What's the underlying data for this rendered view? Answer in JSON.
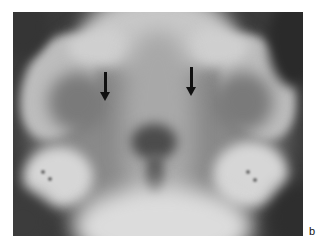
{
  "figure": {
    "panel_label": "b",
    "image_type": "radiograph",
    "annotations": [
      {
        "type": "arrow",
        "direction": "down",
        "x": 105,
        "y_start": 72,
        "y_end": 100
      },
      {
        "type": "arrow",
        "direction": "down",
        "x": 191,
        "y_start": 67,
        "y_end": 96
      }
    ],
    "colors": {
      "background": "#ffffff",
      "film_dark": "#3a3a3a",
      "bone_light": "#d8d8d8",
      "arrow": "#111111"
    }
  }
}
